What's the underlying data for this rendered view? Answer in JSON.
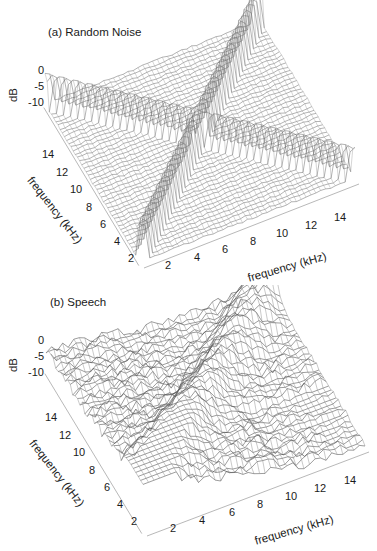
{
  "chart_data": [
    {
      "type": "surface3d",
      "title": "(a) Random Noise",
      "xlabel": "frequency (kHz)",
      "ylabel": "frequency (kHz)",
      "zlabel": "dB",
      "x_ticks": [
        "2",
        "4",
        "6",
        "8",
        "10",
        "12",
        "14"
      ],
      "y_ticks": [
        "2",
        "4",
        "6",
        "8",
        "10",
        "12",
        "14"
      ],
      "z_ticks": [
        "0",
        "-5",
        "-10"
      ],
      "xlim": [
        1,
        16
      ],
      "ylim": [
        1,
        16
      ],
      "zlim": [
        -12,
        0
      ],
      "description": "Mesh surface over a 2-D frequency plane. Floor is flat near -12 dB with small noise; sharp ridges of peaks (~0 dB) run along the diagonal x=y and along two cross lines, forming an X-shaped cross of spikes.",
      "features": [
        {
          "name": "diagonal ridge",
          "path": "x = y",
          "peak_db": 0
        },
        {
          "name": "cross ridge",
          "path": "perpendicular line through center",
          "peak_db": -2
        }
      ],
      "floor_db": -12
    },
    {
      "type": "surface3d",
      "title": "(b) Speech",
      "xlabel": "frequency (kHz)",
      "ylabel": "frequency (kHz)",
      "zlabel": "dB",
      "x_ticks": [
        "2",
        "4",
        "6",
        "8",
        "10",
        "12",
        "14"
      ],
      "y_ticks": [
        "2",
        "4",
        "6",
        "8",
        "10",
        "12",
        "14"
      ],
      "z_ticks": [
        "0",
        "-5",
        "-10"
      ],
      "xlim": [
        1,
        16
      ],
      "ylim": [
        1,
        16
      ],
      "zlim": [
        -12,
        0
      ],
      "description": "Irregular mesh surface; highest values (~-3 to 0 dB) along the diagonal x=y and low-frequency band, decreasing toward high frequencies. Flatter region near -12 dB at high frequencies.",
      "floor_db": -12
    }
  ],
  "panels": {
    "a": {
      "title": "(a) Random Noise",
      "zlabel": "dB",
      "xlabel": "frequency (kHz)",
      "ylabel": "frequency (kHz)",
      "z_ticks": [
        "0",
        "-5",
        "-10"
      ],
      "x_ticks": [
        "2",
        "4",
        "6",
        "8",
        "10",
        "12",
        "14"
      ],
      "y_ticks": [
        "14",
        "12",
        "10",
        "8",
        "6",
        "4",
        "2"
      ]
    },
    "b": {
      "title": "(b) Speech",
      "zlabel": "dB",
      "xlabel": "frequency (kHz)",
      "ylabel": "frequency (kHz)",
      "z_ticks": [
        "0",
        "-5",
        "-10"
      ],
      "x_ticks": [
        "2",
        "4",
        "6",
        "8",
        "10",
        "12",
        "14"
      ],
      "y_ticks": [
        "14",
        "12",
        "10",
        "8",
        "6",
        "4",
        "2"
      ]
    }
  }
}
